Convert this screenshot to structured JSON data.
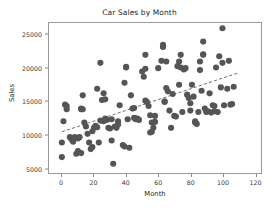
{
  "chart_data": {
    "type": "scatter",
    "title": "Car Sales by Month",
    "xlabel": "Month",
    "ylabel": "Sales",
    "xlim": [
      -8,
      124
    ],
    "ylim": [
      4200,
      26800
    ],
    "xticks": [
      0,
      20,
      40,
      60,
      80,
      100,
      120
    ],
    "yticks": [
      5000,
      10000,
      15000,
      20000,
      25000
    ],
    "grid": false,
    "legend": false,
    "marker_color": "#555555",
    "marker_size": 3.1,
    "trendline": {
      "style": "dashed",
      "color": "#4a4a4a",
      "x": [
        0,
        110
      ],
      "y": [
        10400,
        19300
      ]
    },
    "points": [
      [
        0,
        6600
      ],
      [
        0,
        8800
      ],
      [
        1,
        12000
      ],
      [
        2,
        14500
      ],
      [
        3,
        14300
      ],
      [
        3,
        13800
      ],
      [
        5,
        9600
      ],
      [
        6,
        9300
      ],
      [
        7,
        8900
      ],
      [
        8,
        9500
      ],
      [
        8,
        9600
      ],
      [
        9,
        7100
      ],
      [
        10,
        9400
      ],
      [
        10,
        7500
      ],
      [
        11,
        9600
      ],
      [
        12,
        7200
      ],
      [
        12,
        13800
      ],
      [
        12,
        13900
      ],
      [
        13,
        13800
      ],
      [
        13,
        15900
      ],
      [
        14,
        11800
      ],
      [
        15,
        11200
      ],
      [
        16,
        10100
      ],
      [
        17,
        8800
      ],
      [
        18,
        7800
      ],
      [
        19,
        8100
      ],
      [
        19,
        10500
      ],
      [
        20,
        11000
      ],
      [
        21,
        11300
      ],
      [
        22,
        11100
      ],
      [
        22,
        16900
      ],
      [
        23,
        8800
      ],
      [
        24,
        12100
      ],
      [
        24,
        20800
      ],
      [
        25,
        15200
      ],
      [
        26,
        12000
      ],
      [
        26,
        16200
      ],
      [
        27,
        15300
      ],
      [
        27,
        12400
      ],
      [
        28,
        12200
      ],
      [
        29,
        11000
      ],
      [
        30,
        10900
      ],
      [
        31,
        12300
      ],
      [
        31,
        9100
      ],
      [
        32,
        5600
      ],
      [
        33,
        11200
      ],
      [
        34,
        11000
      ],
      [
        35,
        11500
      ],
      [
        35,
        12000
      ],
      [
        36,
        14400
      ],
      [
        38,
        8400
      ],
      [
        39,
        8200
      ],
      [
        39,
        17800
      ],
      [
        40,
        20100
      ],
      [
        40,
        20200
      ],
      [
        41,
        12300
      ],
      [
        42,
        8000
      ],
      [
        43,
        15900
      ],
      [
        44,
        13900
      ],
      [
        45,
        14000
      ],
      [
        45,
        12500
      ],
      [
        46,
        12400
      ],
      [
        46,
        12300
      ],
      [
        47,
        12400
      ],
      [
        48,
        12200
      ],
      [
        50,
        19500
      ],
      [
        51,
        18700
      ],
      [
        52,
        15100
      ],
      [
        52,
        22000
      ],
      [
        52,
        19900
      ],
      [
        53,
        14900
      ],
      [
        54,
        14300
      ],
      [
        55,
        12900
      ],
      [
        55,
        10300
      ],
      [
        56,
        10400
      ],
      [
        56,
        11800
      ],
      [
        57,
        11000
      ],
      [
        58,
        11900
      ],
      [
        58,
        12800
      ],
      [
        60,
        20000
      ],
      [
        62,
        21100
      ],
      [
        63,
        23500
      ],
      [
        63,
        23300
      ],
      [
        63,
        23200
      ],
      [
        64,
        14900
      ],
      [
        64,
        15000
      ],
      [
        65,
        17000
      ],
      [
        65,
        21000
      ],
      [
        66,
        16500
      ],
      [
        67,
        13600
      ],
      [
        68,
        11000
      ],
      [
        69,
        16100
      ],
      [
        70,
        12800
      ],
      [
        71,
        12700
      ],
      [
        72,
        20300
      ],
      [
        73,
        17500
      ],
      [
        73,
        21000
      ],
      [
        74,
        20100
      ],
      [
        74,
        22000
      ],
      [
        75,
        13400
      ],
      [
        76,
        19800
      ],
      [
        77,
        20000
      ],
      [
        78,
        16000
      ],
      [
        79,
        15500
      ],
      [
        80,
        13600
      ],
      [
        80,
        14700
      ],
      [
        81,
        17500
      ],
      [
        82,
        15700
      ],
      [
        83,
        11800
      ],
      [
        83,
        12000
      ],
      [
        84,
        11600
      ],
      [
        85,
        13400
      ],
      [
        86,
        21000
      ],
      [
        86,
        19700
      ],
      [
        87,
        16600
      ],
      [
        88,
        24000
      ],
      [
        88,
        22000
      ],
      [
        88,
        22100
      ],
      [
        89,
        13900
      ],
      [
        90,
        13500
      ],
      [
        90,
        13400
      ],
      [
        91,
        13500
      ],
      [
        92,
        16200
      ],
      [
        93,
        13300
      ],
      [
        94,
        14400
      ],
      [
        95,
        14300
      ],
      [
        95,
        13500
      ],
      [
        96,
        20100
      ],
      [
        97,
        13400
      ],
      [
        98,
        21800
      ],
      [
        99,
        17100
      ],
      [
        100,
        26000
      ],
      [
        100,
        20800
      ],
      [
        101,
        14400
      ],
      [
        103,
        16900
      ],
      [
        104,
        21100
      ],
      [
        105,
        14500
      ],
      [
        106,
        14600
      ],
      [
        107,
        17200
      ]
    ]
  },
  "figure": {
    "background": "#ffffff",
    "axis_color": "#9a9a9a"
  }
}
